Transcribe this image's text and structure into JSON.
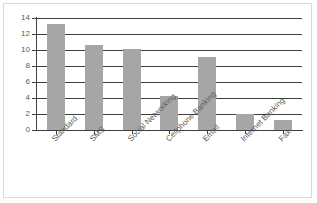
{
  "chart_data": {
    "type": "bar",
    "title": "",
    "subtitle": "",
    "xlabel": "",
    "ylabel": "",
    "categories": [
      "Standard",
      "SMS",
      "Social Networking",
      "Cellphone Banking",
      "Email",
      "Internet Banking",
      "Fax"
    ],
    "values": [
      13.3,
      10.6,
      10.1,
      4.2,
      9.1,
      2.0,
      1.3
    ],
    "ylim": [
      0,
      14
    ],
    "yticks": [
      0,
      2,
      4,
      6,
      8,
      10,
      12,
      14
    ],
    "ytick_labels": [
      "0",
      "2",
      "4",
      "6",
      "8",
      "10",
      "12",
      "14"
    ],
    "grid": "horizontal",
    "legend": "none",
    "series": [
      {
        "name": "",
        "values": [
          13.3,
          10.6,
          10.1,
          4.2,
          9.1,
          2.0,
          1.3
        ]
      }
    ]
  },
  "style": {
    "bar_color": "#a6a6a6",
    "grid_color": "#3f3f3f",
    "axis_color": "#3f3f3f",
    "tick_label_color": "#595959",
    "border_color": "#d9d9d9",
    "background": "#ffffff"
  }
}
